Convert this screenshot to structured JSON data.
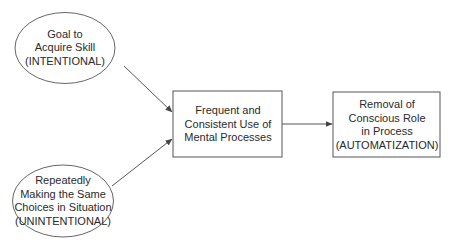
{
  "diagram": {
    "nodes": [
      {
        "id": "goal",
        "shape": "ellipse",
        "label": "Goal to\nAcquire Skill\n(INTENTIONAL)"
      },
      {
        "id": "repeat",
        "shape": "ellipse",
        "label": "Repeatedly\nMaking the Same\nChoices in Situation\n(UNINTENTIONAL)"
      },
      {
        "id": "frequent",
        "shape": "rectangle",
        "label": "Frequent and\nConsistent Use of\nMental Processes"
      },
      {
        "id": "removal",
        "shape": "rectangle",
        "label": "Removal of\nConscious Role\nin Process\n(AUTOMATIZATION)"
      }
    ],
    "edges": [
      {
        "from": "goal",
        "to": "frequent"
      },
      {
        "from": "repeat",
        "to": "frequent"
      },
      {
        "from": "frequent",
        "to": "removal"
      }
    ],
    "colors": {
      "stroke": "#555555",
      "text": "#2a2a2a",
      "background": "#ffffff"
    }
  }
}
